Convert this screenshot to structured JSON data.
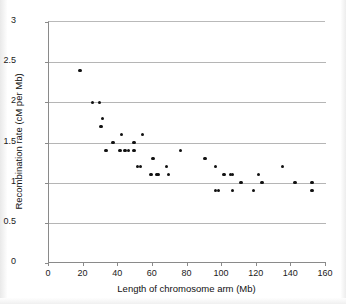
{
  "chart_data": {
    "type": "scatter",
    "title": "",
    "xlabel": "Length of chromosome arm (Mb)",
    "ylabel": "Recombination rate (cM per Mb)",
    "xlim": [
      0,
      160
    ],
    "ylim": [
      0,
      3
    ],
    "xticks": [
      0,
      20,
      40,
      60,
      80,
      100,
      120,
      140,
      160
    ],
    "ytick_labels": [
      "0",
      "0.5",
      "1",
      "1.5",
      "2",
      "2.5",
      "3"
    ],
    "yticks": [
      0,
      0.5,
      1,
      1.5,
      2,
      2.5,
      3
    ],
    "grid": "horizontal",
    "legend": "none",
    "marker": "filled-circle",
    "marker_color": "#111111",
    "points": [
      {
        "x": 18,
        "y": 2.4
      },
      {
        "x": 25,
        "y": 2.0
      },
      {
        "x": 29,
        "y": 2.0
      },
      {
        "x": 30,
        "y": 1.7
      },
      {
        "x": 31,
        "y": 1.8
      },
      {
        "x": 33,
        "y": 1.4
      },
      {
        "x": 37,
        "y": 1.5
      },
      {
        "x": 41,
        "y": 1.4
      },
      {
        "x": 42,
        "y": 1.6
      },
      {
        "x": 44,
        "y": 1.4
      },
      {
        "x": 46,
        "y": 1.4
      },
      {
        "x": 49,
        "y": 1.4
      },
      {
        "x": 49,
        "y": 1.5
      },
      {
        "x": 51,
        "y": 1.2
      },
      {
        "x": 53,
        "y": 1.2
      },
      {
        "x": 54,
        "y": 1.6
      },
      {
        "x": 59,
        "y": 1.1
      },
      {
        "x": 60,
        "y": 1.3
      },
      {
        "x": 62,
        "y": 1.1
      },
      {
        "x": 63,
        "y": 1.1
      },
      {
        "x": 68,
        "y": 1.2
      },
      {
        "x": 69,
        "y": 1.1
      },
      {
        "x": 76,
        "y": 1.4
      },
      {
        "x": 90,
        "y": 1.3
      },
      {
        "x": 96,
        "y": 1.2
      },
      {
        "x": 96,
        "y": 0.9
      },
      {
        "x": 98,
        "y": 0.9
      },
      {
        "x": 101,
        "y": 1.1
      },
      {
        "x": 105,
        "y": 1.1
      },
      {
        "x": 106,
        "y": 1.1
      },
      {
        "x": 106,
        "y": 0.9
      },
      {
        "x": 111,
        "y": 1.0
      },
      {
        "x": 118,
        "y": 0.9
      },
      {
        "x": 121,
        "y": 1.1
      },
      {
        "x": 123,
        "y": 1.0
      },
      {
        "x": 135,
        "y": 1.2
      },
      {
        "x": 142,
        "y": 1.0
      },
      {
        "x": 152,
        "y": 1.0
      },
      {
        "x": 152,
        "y": 0.9
      }
    ]
  }
}
